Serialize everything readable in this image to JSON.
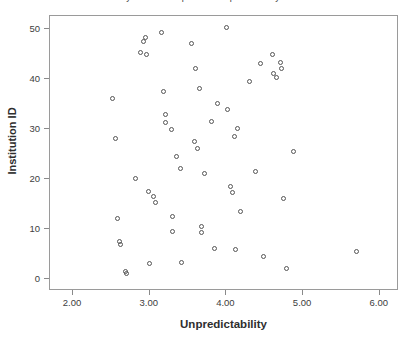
{
  "figure": {
    "title": "Research Library Youth Perceptions of Unpredictability and Institution ID",
    "marker_color": "#555555",
    "frame_color": "#9a9a9a"
  },
  "chart_data": {
    "type": "scatter",
    "title": "Research Library Youth Perceptions of Unpredictability and Institution ID",
    "xlabel": "Unpredictability",
    "ylabel": "Institution ID",
    "xlim": [
      1.7,
      6.25
    ],
    "ylim": [
      -2.5,
      52.5
    ],
    "xticks": [
      2.0,
      3.0,
      4.0,
      5.0,
      6.0
    ],
    "xtick_labels": [
      "2.00",
      "3.00",
      "4.00",
      "5.00",
      "6.00"
    ],
    "yticks": [
      0,
      10,
      20,
      30,
      40,
      50
    ],
    "ytick_labels": [
      "0",
      "10",
      "20",
      "30",
      "40",
      "50"
    ],
    "grid": false,
    "legend": false,
    "marker": "open-circle",
    "n_points": 58,
    "points": [
      {
        "x": 2.52,
        "y": 36.0
      },
      {
        "x": 2.55,
        "y": 28.0
      },
      {
        "x": 2.58,
        "y": 12.0
      },
      {
        "x": 2.6,
        "y": 7.5
      },
      {
        "x": 2.62,
        "y": 6.8
      },
      {
        "x": 2.7,
        "y": 1.0
      },
      {
        "x": 2.82,
        "y": 20.0
      },
      {
        "x": 2.92,
        "y": 47.5
      },
      {
        "x": 2.95,
        "y": 48.2
      },
      {
        "x": 2.88,
        "y": 45.2
      },
      {
        "x": 2.96,
        "y": 44.8
      },
      {
        "x": 2.98,
        "y": 17.5
      },
      {
        "x": 3.0,
        "y": 3.0
      },
      {
        "x": 3.05,
        "y": 16.5
      },
      {
        "x": 3.08,
        "y": 15.2
      },
      {
        "x": 3.15,
        "y": 49.2
      },
      {
        "x": 3.18,
        "y": 37.5
      },
      {
        "x": 3.2,
        "y": 32.8
      },
      {
        "x": 3.21,
        "y": 31.2
      },
      {
        "x": 3.28,
        "y": 29.8
      },
      {
        "x": 3.3,
        "y": 9.5
      },
      {
        "x": 3.35,
        "y": 24.5
      },
      {
        "x": 3.4,
        "y": 22.0
      },
      {
        "x": 3.42,
        "y": 3.2
      },
      {
        "x": 3.55,
        "y": 47.0
      },
      {
        "x": 3.58,
        "y": 27.5
      },
      {
        "x": 3.6,
        "y": 42.0
      },
      {
        "x": 3.62,
        "y": 26.0
      },
      {
        "x": 3.65,
        "y": 38.0
      },
      {
        "x": 3.68,
        "y": 10.5
      },
      {
        "x": 3.68,
        "y": 9.2
      },
      {
        "x": 3.72,
        "y": 21.0
      },
      {
        "x": 3.8,
        "y": 31.5
      },
      {
        "x": 3.85,
        "y": 6.0
      },
      {
        "x": 4.0,
        "y": 50.2
      },
      {
        "x": 4.02,
        "y": 33.8
      },
      {
        "x": 4.05,
        "y": 18.5
      },
      {
        "x": 4.08,
        "y": 17.2
      },
      {
        "x": 4.1,
        "y": 28.5
      },
      {
        "x": 4.12,
        "y": 5.8
      },
      {
        "x": 4.18,
        "y": 13.5
      },
      {
        "x": 4.3,
        "y": 39.5
      },
      {
        "x": 4.38,
        "y": 21.5
      },
      {
        "x": 4.45,
        "y": 43.0
      },
      {
        "x": 4.48,
        "y": 4.5
      },
      {
        "x": 4.6,
        "y": 44.8
      },
      {
        "x": 4.62,
        "y": 41.0
      },
      {
        "x": 4.65,
        "y": 40.2
      },
      {
        "x": 4.7,
        "y": 43.2
      },
      {
        "x": 4.72,
        "y": 42.0
      },
      {
        "x": 4.75,
        "y": 16.0
      },
      {
        "x": 4.78,
        "y": 2.0
      },
      {
        "x": 4.88,
        "y": 25.5
      },
      {
        "x": 3.88,
        "y": 35.0
      },
      {
        "x": 3.3,
        "y": 12.5
      },
      {
        "x": 2.68,
        "y": 1.5
      },
      {
        "x": 5.7,
        "y": 5.5
      },
      {
        "x": 4.15,
        "y": 30.0
      }
    ]
  }
}
